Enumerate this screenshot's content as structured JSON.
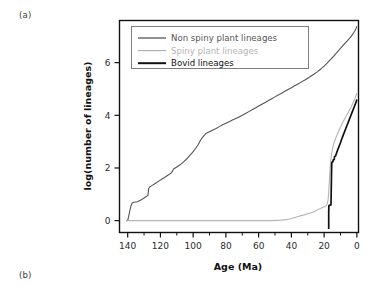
{
  "figure": {
    "panel_a_label": "(a)",
    "panel_b_label": "(b)"
  },
  "chart_data": {
    "type": "line",
    "title": "",
    "xlabel": "Age (Ma)",
    "ylabel": "log(number of lineages)",
    "xlim": [
      145,
      -1
    ],
    "ylim": [
      -0.45,
      7.6
    ],
    "x_reversed": true,
    "grid": false,
    "legend_position": "top-left-inside",
    "xticks": [
      140,
      120,
      100,
      80,
      60,
      40,
      20,
      0
    ],
    "xtick_labels": [
      "140",
      "120",
      "100",
      "80",
      "60",
      "40",
      "20",
      "0"
    ],
    "x_minor_ticks": [
      130,
      110,
      90,
      70,
      50,
      30,
      10
    ],
    "yticks": [
      0,
      2,
      4,
      6
    ],
    "ytick_labels": [
      "0",
      "2",
      "4",
      "6"
    ],
    "series": [
      {
        "name": "Non spiny plant lineages",
        "color": "#555555",
        "width": 1.1,
        "points": [
          [
            141.0,
            0.0
          ],
          [
            140.4,
            0.0
          ],
          [
            139.8,
            0.05
          ],
          [
            139.2,
            0.22
          ],
          [
            138.6,
            0.4
          ],
          [
            138.0,
            0.56
          ],
          [
            137.2,
            0.68
          ],
          [
            136.0,
            0.7
          ],
          [
            134.0,
            0.72
          ],
          [
            132.0,
            0.78
          ],
          [
            130.0,
            0.86
          ],
          [
            128.6,
            0.92
          ],
          [
            127.6,
            0.96
          ],
          [
            127.2,
            1.22
          ],
          [
            126.6,
            1.28
          ],
          [
            125.0,
            1.34
          ],
          [
            123.0,
            1.42
          ],
          [
            121.0,
            1.5
          ],
          [
            119.0,
            1.58
          ],
          [
            117.0,
            1.66
          ],
          [
            115.0,
            1.74
          ],
          [
            113.6,
            1.8
          ],
          [
            112.8,
            1.86
          ],
          [
            112.0,
            1.96
          ],
          [
            110.0,
            2.04
          ],
          [
            108.0,
            2.12
          ],
          [
            106.0,
            2.22
          ],
          [
            104.0,
            2.34
          ],
          [
            102.0,
            2.48
          ],
          [
            100.0,
            2.62
          ],
          [
            98.5,
            2.74
          ],
          [
            97.0,
            2.88
          ],
          [
            96.0,
            3.0
          ],
          [
            95.0,
            3.1
          ],
          [
            94.0,
            3.18
          ],
          [
            93.0,
            3.26
          ],
          [
            92.0,
            3.32
          ],
          [
            90.0,
            3.38
          ],
          [
            88.0,
            3.44
          ],
          [
            86.0,
            3.5
          ],
          [
            84.0,
            3.57
          ],
          [
            82.0,
            3.64
          ],
          [
            80.0,
            3.7
          ],
          [
            78.0,
            3.76
          ],
          [
            76.0,
            3.82
          ],
          [
            74.0,
            3.88
          ],
          [
            72.0,
            3.94
          ],
          [
            70.0,
            4.0
          ],
          [
            68.0,
            4.07
          ],
          [
            66.0,
            4.14
          ],
          [
            64.0,
            4.21
          ],
          [
            62.0,
            4.28
          ],
          [
            60.0,
            4.35
          ],
          [
            58.0,
            4.42
          ],
          [
            56.0,
            4.49
          ],
          [
            54.0,
            4.56
          ],
          [
            52.0,
            4.63
          ],
          [
            50.0,
            4.7
          ],
          [
            48.0,
            4.77
          ],
          [
            46.0,
            4.84
          ],
          [
            44.0,
            4.91
          ],
          [
            42.0,
            4.98
          ],
          [
            40.0,
            5.05
          ],
          [
            38.0,
            5.12
          ],
          [
            36.0,
            5.19
          ],
          [
            34.0,
            5.26
          ],
          [
            32.0,
            5.33
          ],
          [
            30.0,
            5.41
          ],
          [
            28.0,
            5.49
          ],
          [
            26.0,
            5.57
          ],
          [
            24.0,
            5.66
          ],
          [
            22.0,
            5.76
          ],
          [
            20.0,
            5.87
          ],
          [
            18.0,
            5.99
          ],
          [
            16.0,
            6.12
          ],
          [
            14.0,
            6.26
          ],
          [
            12.0,
            6.4
          ],
          [
            10.0,
            6.54
          ],
          [
            8.0,
            6.68
          ],
          [
            6.0,
            6.82
          ],
          [
            4.0,
            6.96
          ],
          [
            2.5,
            7.08
          ],
          [
            1.5,
            7.18
          ],
          [
            0.6,
            7.28
          ],
          [
            0.0,
            7.38
          ]
        ]
      },
      {
        "name": "Spiny plant lineages",
        "color": "#b4b4b4",
        "width": 1.1,
        "points": [
          [
            141.0,
            0.0
          ],
          [
            120.0,
            0.0
          ],
          [
            100.0,
            0.0
          ],
          [
            80.0,
            0.0
          ],
          [
            70.0,
            0.0
          ],
          [
            60.0,
            0.0
          ],
          [
            52.0,
            0.0
          ],
          [
            46.0,
            0.02
          ],
          [
            43.0,
            0.04
          ],
          [
            41.0,
            0.06
          ],
          [
            40.0,
            0.08
          ],
          [
            38.0,
            0.12
          ],
          [
            36.0,
            0.16
          ],
          [
            34.0,
            0.19
          ],
          [
            32.0,
            0.22
          ],
          [
            30.0,
            0.26
          ],
          [
            28.0,
            0.3
          ],
          [
            26.0,
            0.34
          ],
          [
            25.0,
            0.38
          ],
          [
            24.0,
            0.42
          ],
          [
            23.0,
            0.44
          ],
          [
            22.0,
            0.47
          ],
          [
            21.0,
            0.5
          ],
          [
            20.0,
            0.53
          ],
          [
            19.0,
            0.56
          ],
          [
            18.5,
            0.6
          ],
          [
            18.0,
            0.66
          ],
          [
            17.6,
            0.78
          ],
          [
            17.3,
            1.0
          ],
          [
            17.0,
            1.3
          ],
          [
            16.7,
            1.65
          ],
          [
            16.4,
            1.95
          ],
          [
            16.0,
            2.25
          ],
          [
            15.5,
            2.5
          ],
          [
            15.0,
            2.7
          ],
          [
            14.0,
            2.95
          ],
          [
            13.0,
            3.12
          ],
          [
            12.0,
            3.28
          ],
          [
            11.0,
            3.42
          ],
          [
            10.0,
            3.55
          ],
          [
            9.0,
            3.68
          ],
          [
            8.0,
            3.8
          ],
          [
            7.0,
            3.92
          ],
          [
            6.0,
            4.03
          ],
          [
            5.0,
            4.14
          ],
          [
            4.0,
            4.26
          ],
          [
            3.0,
            4.38
          ],
          [
            2.0,
            4.52
          ],
          [
            1.2,
            4.64
          ],
          [
            0.6,
            4.74
          ],
          [
            0.0,
            4.84
          ]
        ]
      },
      {
        "name": "Bovid lineages",
        "color": "#111111",
        "width": 1.7,
        "points": [
          [
            17.2,
            -0.32
          ],
          [
            17.2,
            0.0
          ],
          [
            17.2,
            0.3
          ],
          [
            17.1,
            0.55
          ],
          [
            17.0,
            0.58
          ],
          [
            16.4,
            0.58
          ],
          [
            16.3,
            0.6
          ],
          [
            15.8,
            0.6
          ],
          [
            15.7,
            1.0
          ],
          [
            15.6,
            1.35
          ],
          [
            15.5,
            1.7
          ],
          [
            15.4,
            2.05
          ],
          [
            15.3,
            2.22
          ],
          [
            14.6,
            2.24
          ],
          [
            14.5,
            2.3
          ],
          [
            13.8,
            2.32
          ],
          [
            13.7,
            2.42
          ],
          [
            13.0,
            2.46
          ],
          [
            12.5,
            2.55
          ],
          [
            12.0,
            2.64
          ],
          [
            11.5,
            2.72
          ],
          [
            11.0,
            2.8
          ],
          [
            10.5,
            2.88
          ],
          [
            10.0,
            2.96
          ],
          [
            9.5,
            3.05
          ],
          [
            9.0,
            3.14
          ],
          [
            8.5,
            3.22
          ],
          [
            8.0,
            3.3
          ],
          [
            7.5,
            3.38
          ],
          [
            7.0,
            3.46
          ],
          [
            6.5,
            3.54
          ],
          [
            6.0,
            3.62
          ],
          [
            5.5,
            3.7
          ],
          [
            5.0,
            3.78
          ],
          [
            4.5,
            3.86
          ],
          [
            4.0,
            3.94
          ],
          [
            3.5,
            4.02
          ],
          [
            3.0,
            4.1
          ],
          [
            2.5,
            4.18
          ],
          [
            2.0,
            4.26
          ],
          [
            1.5,
            4.34
          ],
          [
            1.0,
            4.42
          ],
          [
            0.5,
            4.5
          ],
          [
            0.0,
            4.6
          ]
        ]
      }
    ],
    "legend": [
      {
        "label": "Non spiny plant lineages",
        "color": "#555555",
        "width": 1.3
      },
      {
        "label": "Spiny plant lineages",
        "color": "#b4b4b4",
        "width": 1.3
      },
      {
        "label": "Bovid lineages",
        "color": "#111111",
        "width": 2.0
      }
    ]
  }
}
